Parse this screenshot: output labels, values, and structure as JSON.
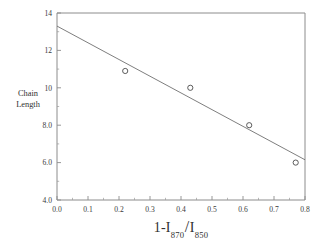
{
  "chart_data": {
    "type": "scatter",
    "title": "",
    "xlabel": "1-I870/I850",
    "xlabel_parts": {
      "prefix": "1-I",
      "sub1": "870",
      "slash": "/",
      "mid": "I",
      "sub2": "850"
    },
    "ylabel": "Chain Length",
    "ylabel_line1": "Chain",
    "ylabel_line2": "Length",
    "xlim": [
      0.0,
      0.8
    ],
    "ylim": [
      4.0,
      14.0
    ],
    "xticks": [
      0.0,
      0.1,
      0.2,
      0.3,
      0.4,
      0.5,
      0.6,
      0.7,
      0.8
    ],
    "xtick_labels": [
      "0.0",
      "0.1",
      "0.2",
      "0.3",
      "0.4",
      "0.5",
      "0.6",
      "0.7",
      "0.8"
    ],
    "yticks": [
      4.0,
      6.0,
      8.0,
      10.0,
      12.0,
      14.0
    ],
    "ytick_labels": [
      "4.0",
      "6.0",
      "8.0",
      "10",
      "12",
      "14"
    ],
    "minor_ticks": true,
    "grid": false,
    "legend": null,
    "marker": "open-circle",
    "series": [
      {
        "name": "measurements",
        "marker": "open-circle",
        "x": [
          0.22,
          0.43,
          0.62,
          0.77
        ],
        "y": [
          10.9,
          10.0,
          8.0,
          6.0
        ]
      }
    ],
    "fit_line": {
      "name": "linear-fit",
      "x": [
        0.0,
        0.8
      ],
      "y": [
        13.3,
        6.15
      ],
      "slope": -8.94,
      "intercept": 13.3
    },
    "colors": {
      "axis": "#8c8c8c",
      "fit_line": "#6f6f6f",
      "marker": "#4a4a4a",
      "text": "#2f2f2f",
      "background": "#ffffff"
    }
  }
}
